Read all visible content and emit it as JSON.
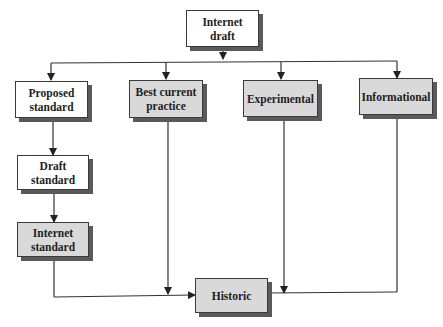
{
  "diagram": {
    "colors": {
      "white_box": "#ffffff",
      "gray_box": "#d9d9d9",
      "border": "#3a3a3a",
      "shadow": "#5a5a5a",
      "line": "#333333"
    },
    "nodes": {
      "internet_draft": {
        "label_1": "Internet",
        "label_2": "draft",
        "style": "white"
      },
      "proposed_standard": {
        "label_1": "Proposed",
        "label_2": "standard",
        "style": "white"
      },
      "best_current_practice": {
        "label_1": "Best current",
        "label_2": "practice",
        "style": "gray"
      },
      "experimental": {
        "label_1": "Experimental",
        "style": "gray"
      },
      "informational": {
        "label_1": "Informational",
        "style": "gray"
      },
      "draft_standard": {
        "label_1": "Draft",
        "label_2": "standard",
        "style": "white"
      },
      "internet_standard": {
        "label_1": "Internet",
        "label_2": "standard",
        "style": "gray"
      },
      "historic": {
        "label_1": "Historic",
        "style": "gray"
      }
    },
    "edges": [
      [
        "internet_draft",
        "proposed_standard"
      ],
      [
        "internet_draft",
        "best_current_practice"
      ],
      [
        "internet_draft",
        "experimental"
      ],
      [
        "internet_draft",
        "informational"
      ],
      [
        "proposed_standard",
        "draft_standard"
      ],
      [
        "draft_standard",
        "internet_standard"
      ],
      [
        "internet_standard",
        "historic"
      ],
      [
        "best_current_practice",
        "historic"
      ],
      [
        "experimental",
        "historic"
      ],
      [
        "informational",
        "historic"
      ]
    ]
  }
}
